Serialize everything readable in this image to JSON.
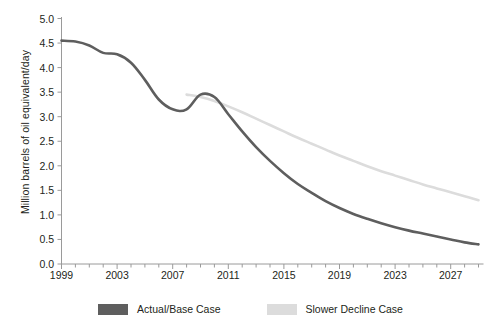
{
  "chart_data": {
    "type": "line",
    "title": "",
    "xlabel": "",
    "ylabel": "Million barrels of oil equivalent/day",
    "xlim": [
      1999,
      2029
    ],
    "ylim": [
      0.0,
      5.0
    ],
    "grid": false,
    "legend_position": "bottom-center",
    "x_tick_labels": [
      "1999",
      "2003",
      "2007",
      "2011",
      "2015",
      "2019",
      "2023",
      "2027"
    ],
    "x_tick_values": [
      1999,
      2003,
      2007,
      2011,
      2015,
      2019,
      2023,
      2027
    ],
    "x_minor_tick_interval": 1,
    "y_tick_labels": [
      "0.0",
      "0.5",
      "1.0",
      "1.5",
      "2.0",
      "2.5",
      "3.0",
      "3.5",
      "4.0",
      "4.5",
      "5.0"
    ],
    "y_tick_values": [
      0.0,
      0.5,
      1.0,
      1.5,
      2.0,
      2.5,
      3.0,
      3.5,
      4.0,
      4.5,
      5.0
    ],
    "series": [
      {
        "name": "Actual/Base Case",
        "color": "#5e5e5e",
        "x": [
          1999,
          2000,
          2001,
          2002,
          2003,
          2004,
          2005,
          2006,
          2007,
          2008,
          2009,
          2010,
          2011,
          2012,
          2013,
          2014,
          2015,
          2016,
          2017,
          2018,
          2019,
          2020,
          2021,
          2022,
          2023,
          2024,
          2025,
          2026,
          2027,
          2028,
          2029
        ],
        "values": [
          4.55,
          4.53,
          4.45,
          4.3,
          4.27,
          4.1,
          3.75,
          3.35,
          3.15,
          3.15,
          3.45,
          3.4,
          3.05,
          2.7,
          2.38,
          2.1,
          1.85,
          1.63,
          1.45,
          1.28,
          1.14,
          1.02,
          0.92,
          0.83,
          0.75,
          0.68,
          0.62,
          0.56,
          0.5,
          0.44,
          0.4
        ]
      },
      {
        "name": "Slower Decline Case",
        "color": "#dcdcdc",
        "x": [
          2008,
          2009,
          2010,
          2011,
          2012,
          2013,
          2014,
          2015,
          2016,
          2017,
          2018,
          2019,
          2020,
          2021,
          2022,
          2023,
          2024,
          2025,
          2026,
          2027,
          2028,
          2029
        ],
        "values": [
          3.45,
          3.4,
          3.32,
          3.21,
          3.09,
          2.96,
          2.83,
          2.7,
          2.57,
          2.45,
          2.33,
          2.21,
          2.1,
          1.99,
          1.89,
          1.8,
          1.71,
          1.62,
          1.54,
          1.46,
          1.38,
          1.3
        ]
      }
    ]
  },
  "axis": {
    "y_title": "Million barrels of oil equivalent/day",
    "axis_color": "#9a9a9a"
  },
  "legend": {
    "items": [
      {
        "label": "Actual/Base Case",
        "color": "#5e5e5e"
      },
      {
        "label": "Slower Decline Case",
        "color": "#dcdcdc"
      }
    ]
  }
}
